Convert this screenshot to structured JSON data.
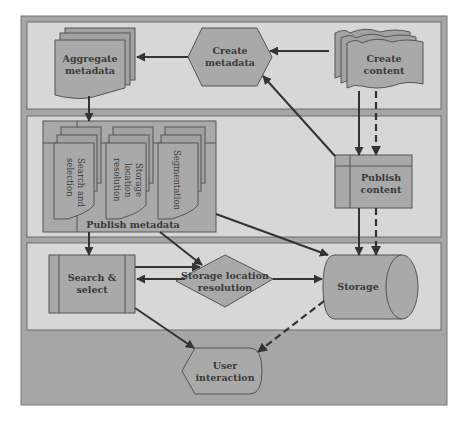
{
  "diagram": {
    "type": "flow-diagram",
    "colors": {
      "frame": "#a6a6a6",
      "panel": "#d7d7d7",
      "shape": "#a9a9a9",
      "stroke": "#555555",
      "arrow": "#333333",
      "text": "#3a3a3a"
    },
    "panels": [
      {
        "id": "content-creation-panel"
      },
      {
        "id": "publishing-panel"
      },
      {
        "id": "retrieval-panel"
      }
    ],
    "nodes": {
      "aggregate_metadata": {
        "line1": "Aggregate",
        "line2": "metadata",
        "shape": "multi-document"
      },
      "create_metadata": {
        "line1": "Create",
        "line2": "metadata",
        "shape": "hexagon"
      },
      "create_content": {
        "line1": "Create",
        "line2": "content",
        "shape": "multi-tape"
      },
      "publish_metadata": {
        "label": "Publish metadata",
        "shape": "internal-storage"
      },
      "search_and_selection": {
        "line1": "Search and",
        "line2": "selection",
        "shape": "multi-document-rotated"
      },
      "storage_location_resolution_doc": {
        "line1": "Storage",
        "line2": "location",
        "line3": "resolution",
        "shape": "multi-document-rotated"
      },
      "segmentation": {
        "line1": "Segmentation",
        "shape": "multi-document-rotated"
      },
      "publish_content": {
        "line1": "Publish",
        "line2": "content",
        "shape": "internal-storage"
      },
      "search_select": {
        "line1": "Search &",
        "line2": "select",
        "shape": "predefined-process"
      },
      "storage_location_resolution": {
        "line1": "Storage location",
        "line2": "resolution",
        "shape": "decision"
      },
      "storage": {
        "label": "Storage",
        "shape": "cylinder"
      },
      "user_interaction": {
        "line1": "User",
        "line2": "interaction",
        "shape": "display"
      }
    },
    "edges": [
      {
        "from": "create_metadata",
        "to": "aggregate_metadata",
        "style": "solid"
      },
      {
        "from": "create_content",
        "to": "create_metadata",
        "style": "solid"
      },
      {
        "from": "aggregate_metadata",
        "to": "publish_metadata",
        "style": "solid"
      },
      {
        "from": "publish_content",
        "to": "create_metadata",
        "style": "solid"
      },
      {
        "from": "create_content",
        "to": "publish_content",
        "style": "solid"
      },
      {
        "from": "create_content",
        "to": "publish_content",
        "style": "dashed"
      },
      {
        "from": "publish_content",
        "to": "storage",
        "style": "solid"
      },
      {
        "from": "publish_content",
        "to": "storage",
        "style": "dashed"
      },
      {
        "from": "publish_metadata",
        "to": "search_select",
        "style": "solid"
      },
      {
        "from": "publish_metadata",
        "to": "storage_location_resolution",
        "style": "solid"
      },
      {
        "from": "publish_metadata",
        "to": "storage",
        "style": "solid"
      },
      {
        "from": "search_select",
        "to": "storage_location_resolution",
        "style": "solid"
      },
      {
        "from": "storage_location_resolution",
        "to": "search_select",
        "style": "solid"
      },
      {
        "from": "storage_location_resolution",
        "to": "storage",
        "style": "solid"
      },
      {
        "from": "search_select",
        "to": "user_interaction",
        "style": "solid"
      },
      {
        "from": "storage",
        "to": "user_interaction",
        "style": "dashed"
      }
    ]
  }
}
